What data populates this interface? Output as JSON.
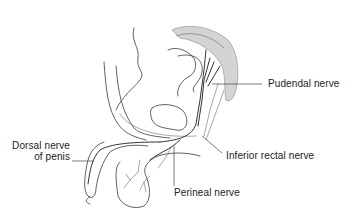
{
  "figure": {
    "labels": [
      {
        "id": "pudendal",
        "text": "Pudendal nerve"
      },
      {
        "id": "dorsal_line1",
        "text": "Dorsal nerve"
      },
      {
        "id": "dorsal_line2",
        "text": "of penis"
      },
      {
        "id": "inferior_rectal",
        "text": "Inferior rectal nerve"
      },
      {
        "id": "perineal",
        "text": "Perineal nerve"
      }
    ],
    "colors": {
      "background": "#ffffff",
      "line": "#3a3a3a",
      "sacrum_stipple": "#c8c8c8",
      "text": "#222222"
    }
  }
}
